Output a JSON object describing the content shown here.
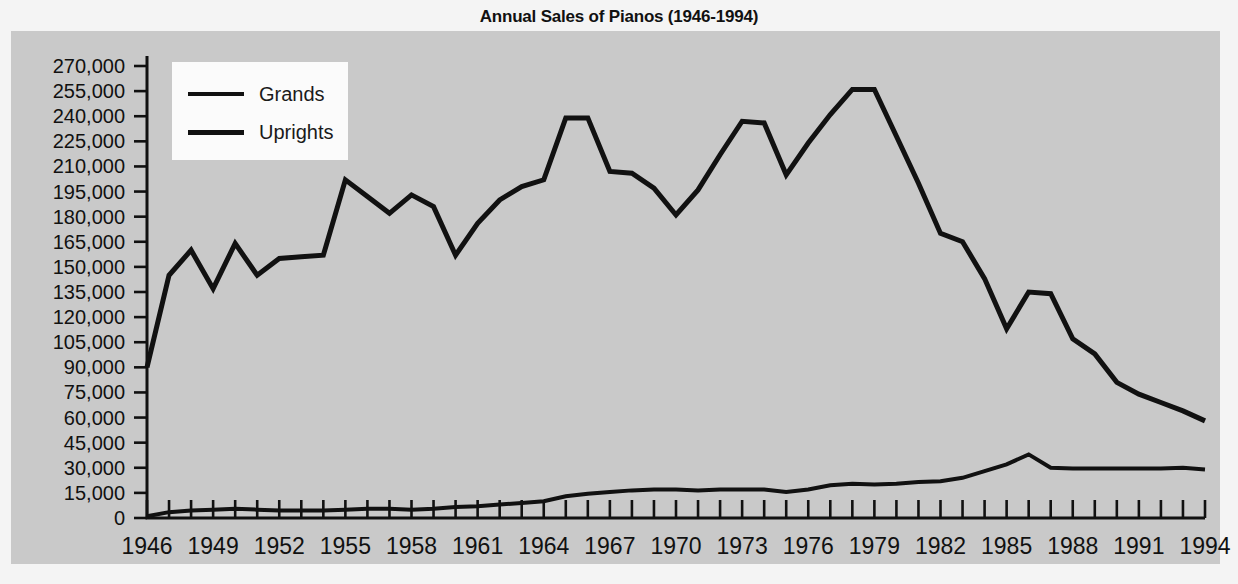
{
  "chart_data": {
    "type": "line",
    "title": "Annual Sales of Pianos (1946-1994)",
    "xlabel": "",
    "ylabel": "",
    "xlim": [
      1946,
      1994
    ],
    "ylim": [
      0,
      270000
    ],
    "grid": false,
    "legend_position": "top-left",
    "y_ticks": [
      0,
      15000,
      30000,
      45000,
      60000,
      75000,
      90000,
      105000,
      120000,
      135000,
      150000,
      165000,
      180000,
      195000,
      210000,
      225000,
      240000,
      255000,
      270000
    ],
    "y_tick_labels": [
      "0",
      "15,000",
      "30,000",
      "45,000",
      "60,000",
      "75,000",
      "90,000",
      "105,000",
      "120,000",
      "135,000",
      "150,000",
      "165,000",
      "180,000",
      "195,000",
      "210,000",
      "225,000",
      "240,000",
      "255,000",
      "270,000"
    ],
    "x_tick_labels": [
      "1946",
      "1949",
      "1952",
      "1955",
      "1958",
      "1961",
      "1964",
      "1967",
      "1970",
      "1973",
      "1976",
      "1979",
      "1982",
      "1985",
      "1988",
      "1991",
      "1994"
    ],
    "x": [
      1946,
      1947,
      1948,
      1949,
      1950,
      1951,
      1952,
      1953,
      1954,
      1955,
      1956,
      1957,
      1958,
      1959,
      1960,
      1961,
      1962,
      1963,
      1964,
      1965,
      1966,
      1967,
      1968,
      1969,
      1970,
      1971,
      1972,
      1973,
      1974,
      1975,
      1976,
      1977,
      1978,
      1979,
      1980,
      1981,
      1982,
      1983,
      1984,
      1985,
      1986,
      1987,
      1988,
      1989,
      1990,
      1991,
      1992,
      1993,
      1994
    ],
    "series": [
      {
        "name": "Grands",
        "values": [
          1000,
          3500,
          4500,
          5000,
          5500,
          5000,
          4500,
          4500,
          4500,
          5000,
          5500,
          5500,
          5000,
          5500,
          6500,
          7000,
          8000,
          9000,
          10000,
          13000,
          14500,
          15500,
          16500,
          17000,
          17000,
          16500,
          17000,
          17000,
          17000,
          15500,
          17000,
          19500,
          20500,
          20000,
          20500,
          21500,
          22000,
          24000,
          28000,
          32000,
          38000,
          30000,
          29500,
          29500,
          29500,
          29500,
          29500,
          30000,
          29000
        ]
      },
      {
        "name": "Uprights",
        "values": [
          90000,
          145000,
          160000,
          137000,
          164000,
          145000,
          155000,
          156000,
          157000,
          202000,
          192000,
          182000,
          193000,
          186000,
          157000,
          176000,
          190000,
          198000,
          202000,
          239000,
          239000,
          207000,
          206000,
          197000,
          181000,
          196000,
          217000,
          237000,
          236000,
          205000,
          224000,
          241000,
          256000,
          256000,
          228000,
          200000,
          170000,
          165000,
          143000,
          113000,
          135000,
          134000,
          107000,
          98000,
          81000,
          74000,
          69000,
          64000,
          58000
        ]
      }
    ],
    "series_styles": [
      {
        "name": "Grands",
        "color": "#111111",
        "width": 4
      },
      {
        "name": "Uprights",
        "color": "#111111",
        "width": 5
      }
    ]
  },
  "legend": {
    "items": [
      {
        "label": "Grands"
      },
      {
        "label": "Uprights"
      }
    ]
  }
}
